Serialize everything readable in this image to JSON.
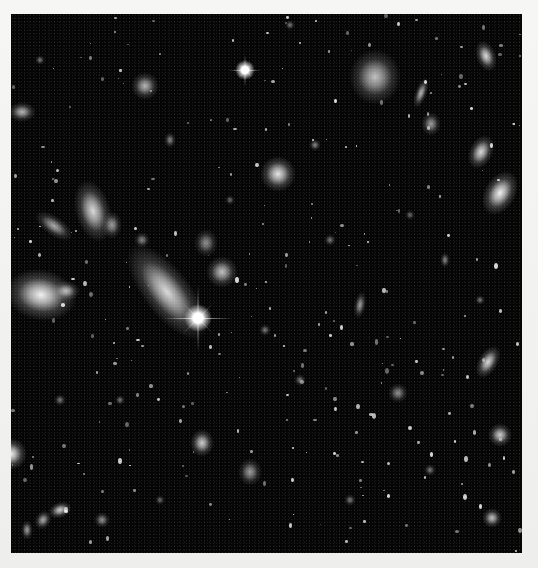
{
  "image": {
    "subject": "deep-field galaxy image",
    "palette": {
      "sky": "#050505",
      "border": "#f3f3f1",
      "core": "#ffffff",
      "glow": "#cfcfcf"
    }
  },
  "stars": [
    {
      "x": 198,
      "y": 318,
      "r": 9,
      "spike": 34
    },
    {
      "x": 245,
      "y": 70,
      "r": 6,
      "spike": 16
    }
  ],
  "galaxies": [
    {
      "x": 167,
      "y": 292,
      "w": 24,
      "h": 58,
      "rot": -38,
      "b": 0.85
    },
    {
      "x": 41,
      "y": 295,
      "w": 36,
      "h": 26,
      "rot": 10,
      "b": 0.95
    },
    {
      "x": 66,
      "y": 291,
      "w": 14,
      "h": 10,
      "rot": 0,
      "b": 0.7
    },
    {
      "x": 93,
      "y": 211,
      "w": 18,
      "h": 32,
      "rot": -15,
      "b": 0.85
    },
    {
      "x": 112,
      "y": 225,
      "w": 10,
      "h": 14,
      "rot": 0,
      "b": 0.6
    },
    {
      "x": 54,
      "y": 226,
      "w": 22,
      "h": 10,
      "rot": 35,
      "b": 0.65
    },
    {
      "x": 375,
      "y": 77,
      "w": 26,
      "h": 28,
      "rot": 0,
      "b": 0.75
    },
    {
      "x": 278,
      "y": 174,
      "w": 18,
      "h": 18,
      "rot": 0,
      "b": 0.9
    },
    {
      "x": 222,
      "y": 272,
      "w": 16,
      "h": 16,
      "rot": 0,
      "b": 0.75
    },
    {
      "x": 206,
      "y": 243,
      "w": 12,
      "h": 14,
      "rot": 0,
      "b": 0.55
    },
    {
      "x": 500,
      "y": 193,
      "w": 16,
      "h": 24,
      "rot": 30,
      "b": 0.95
    },
    {
      "x": 481,
      "y": 152,
      "w": 12,
      "h": 18,
      "rot": 25,
      "b": 0.85
    },
    {
      "x": 486,
      "y": 56,
      "w": 10,
      "h": 16,
      "rot": -20,
      "b": 0.85
    },
    {
      "x": 431,
      "y": 124,
      "w": 10,
      "h": 12,
      "rot": 0,
      "b": 0.6
    },
    {
      "x": 421,
      "y": 93,
      "w": 6,
      "h": 16,
      "rot": 20,
      "b": 0.7
    },
    {
      "x": 145,
      "y": 86,
      "w": 14,
      "h": 14,
      "rot": 0,
      "b": 0.7
    },
    {
      "x": 22,
      "y": 112,
      "w": 14,
      "h": 10,
      "rot": 0,
      "b": 0.7
    },
    {
      "x": 11,
      "y": 454,
      "w": 16,
      "h": 16,
      "rot": 0,
      "b": 0.95
    },
    {
      "x": 202,
      "y": 443,
      "w": 12,
      "h": 14,
      "rot": 0,
      "b": 0.8
    },
    {
      "x": 250,
      "y": 472,
      "w": 12,
      "h": 14,
      "rot": 0,
      "b": 0.6
    },
    {
      "x": 488,
      "y": 362,
      "w": 10,
      "h": 18,
      "rot": 30,
      "b": 0.85
    },
    {
      "x": 500,
      "y": 435,
      "w": 12,
      "h": 12,
      "rot": 0,
      "b": 0.8
    },
    {
      "x": 492,
      "y": 518,
      "w": 10,
      "h": 10,
      "rot": 0,
      "b": 0.75
    },
    {
      "x": 360,
      "y": 305,
      "w": 6,
      "h": 14,
      "rot": 10,
      "b": 0.6
    },
    {
      "x": 398,
      "y": 393,
      "w": 10,
      "h": 10,
      "rot": 0,
      "b": 0.55
    },
    {
      "x": 60,
      "y": 510,
      "w": 12,
      "h": 8,
      "rot": -20,
      "b": 0.8
    },
    {
      "x": 43,
      "y": 520,
      "w": 8,
      "h": 10,
      "rot": 30,
      "b": 0.65
    },
    {
      "x": 27,
      "y": 530,
      "w": 6,
      "h": 10,
      "rot": 0,
      "b": 0.6
    },
    {
      "x": 102,
      "y": 520,
      "w": 8,
      "h": 8,
      "rot": 0,
      "b": 0.55
    },
    {
      "x": 315,
      "y": 145,
      "w": 6,
      "h": 6,
      "rot": 0,
      "b": 0.5
    },
    {
      "x": 170,
      "y": 140,
      "w": 6,
      "h": 8,
      "rot": 0,
      "b": 0.5
    },
    {
      "x": 142,
      "y": 240,
      "w": 8,
      "h": 8,
      "rot": 0,
      "b": 0.5
    },
    {
      "x": 300,
      "y": 380,
      "w": 6,
      "h": 6,
      "rot": 0,
      "b": 0.45
    },
    {
      "x": 430,
      "y": 470,
      "w": 6,
      "h": 6,
      "rot": 0,
      "b": 0.45
    },
    {
      "x": 330,
      "y": 240,
      "w": 6,
      "h": 6,
      "rot": 0,
      "b": 0.45
    },
    {
      "x": 445,
      "y": 260,
      "w": 5,
      "h": 8,
      "rot": 0,
      "b": 0.5
    },
    {
      "x": 265,
      "y": 330,
      "w": 6,
      "h": 6,
      "rot": 0,
      "b": 0.45
    },
    {
      "x": 120,
      "y": 400,
      "w": 5,
      "h": 5,
      "rot": 0,
      "b": 0.45
    },
    {
      "x": 60,
      "y": 400,
      "w": 6,
      "h": 6,
      "rot": 0,
      "b": 0.45
    },
    {
      "x": 480,
      "y": 300,
      "w": 5,
      "h": 5,
      "rot": 0,
      "b": 0.45
    },
    {
      "x": 410,
      "y": 215,
      "w": 5,
      "h": 5,
      "rot": 0,
      "b": 0.4
    },
    {
      "x": 230,
      "y": 200,
      "w": 5,
      "h": 5,
      "rot": 0,
      "b": 0.4
    },
    {
      "x": 350,
      "y": 500,
      "w": 6,
      "h": 6,
      "rot": 0,
      "b": 0.45
    },
    {
      "x": 160,
      "y": 500,
      "w": 5,
      "h": 5,
      "rot": 0,
      "b": 0.4
    },
    {
      "x": 40,
      "y": 60,
      "w": 5,
      "h": 5,
      "rot": 0,
      "b": 0.45
    },
    {
      "x": 290,
      "y": 25,
      "w": 5,
      "h": 5,
      "rot": 0,
      "b": 0.45
    }
  ]
}
